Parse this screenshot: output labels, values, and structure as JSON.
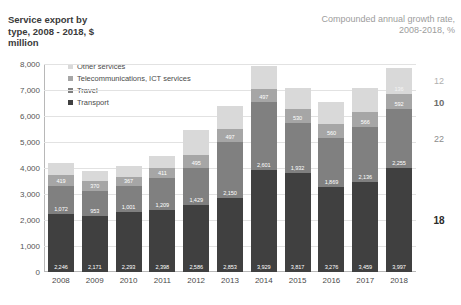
{
  "header": {
    "title_left": "Service export by\ntype, 2008 - 2018, $\nmillion",
    "title_right": "Compounded annual growth rate,\n2008-2018, %"
  },
  "legend": {
    "items": [
      {
        "label": "Other services",
        "color": "#d9d9d9"
      },
      {
        "label": "Telecommunications, ICT services",
        "color": "#a6a6a6"
      },
      {
        "label": "Travel",
        "color": "#808080"
      },
      {
        "label": "Transport",
        "color": "#404040"
      }
    ]
  },
  "chart_data": {
    "type": "bar",
    "stacked": true,
    "title": "Service export by type, 2008 - 2018, $ million",
    "xlabel": "",
    "ylabel": "",
    "ylim": [
      0,
      8000
    ],
    "yticks": [
      "0",
      "1,000",
      "2,000",
      "3,000",
      "4,000",
      "5,000",
      "6,000",
      "7,000",
      "8,000"
    ],
    "grid": true,
    "legend_position": "top-left",
    "categories": [
      "2008",
      "2009",
      "2010",
      "2011",
      "2012",
      "2013",
      "2014",
      "2015",
      "2016",
      "2017",
      "2018"
    ],
    "series": [
      {
        "name": "Transport",
        "color": "#404040",
        "values": [
          2246,
          2171,
          2293,
          2398,
          2586,
          2853,
          3929,
          3817,
          3276,
          3459,
          3997
        ],
        "labels": [
          "2,246",
          "2,171",
          "2,293",
          "2,398",
          "2,586",
          "2,853",
          "3,929",
          "3,817",
          "3,276",
          "3,459",
          "3,997"
        ],
        "cagr": "18"
      },
      {
        "name": "Travel",
        "color": "#808080",
        "values": [
          1072,
          953,
          1001,
          1209,
          1429,
          2150,
          2601,
          1932,
          1869,
          2136,
          2255
        ],
        "labels": [
          "1,072",
          "953",
          "1,001",
          "1,209",
          "1,429",
          "2,150",
          "2,601",
          "1,932",
          "1,869",
          "2,136",
          "2,255"
        ],
        "cagr": "22"
      },
      {
        "name": "Telecommunications, ICT services",
        "color": "#a6a6a6",
        "values": [
          419,
          370,
          367,
          411,
          495,
          497,
          497,
          530,
          560,
          566,
          592
        ],
        "labels": [
          "419",
          "370",
          "367",
          "411",
          "495",
          "497",
          "497",
          "530",
          "560",
          "566",
          "592"
        ],
        "cagr": "10"
      },
      {
        "name": "Other services",
        "color": "#d9d9d9",
        "values": [
          470,
          400,
          400,
          430,
          940,
          870,
          900,
          810,
          850,
          930,
          1000
        ],
        "labels": [
          "",
          "",
          "",
          "",
          "",
          "",
          "",
          "",
          "",
          "",
          "136"
        ],
        "cagr": "12"
      }
    ],
    "cagr_axis": {
      "title": "Compounded annual growth rate, 2008-2018, %",
      "values": [
        "12",
        "10",
        "22",
        "18"
      ]
    }
  }
}
